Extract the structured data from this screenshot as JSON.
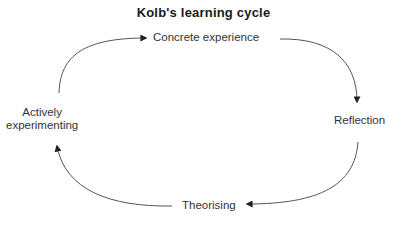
{
  "title": "Kolb's learning cycle",
  "stages": [
    {
      "id": "concrete",
      "label": "Concrete experience"
    },
    {
      "id": "reflection",
      "label": "Reflection"
    },
    {
      "id": "theorising",
      "label": "Theorising"
    },
    {
      "id": "active",
      "label_line1": "Actively",
      "label_line2": "experimenting"
    }
  ],
  "colors": {
    "arrow": "#555555",
    "text": "#333333",
    "title": "#1a1a1a"
  }
}
